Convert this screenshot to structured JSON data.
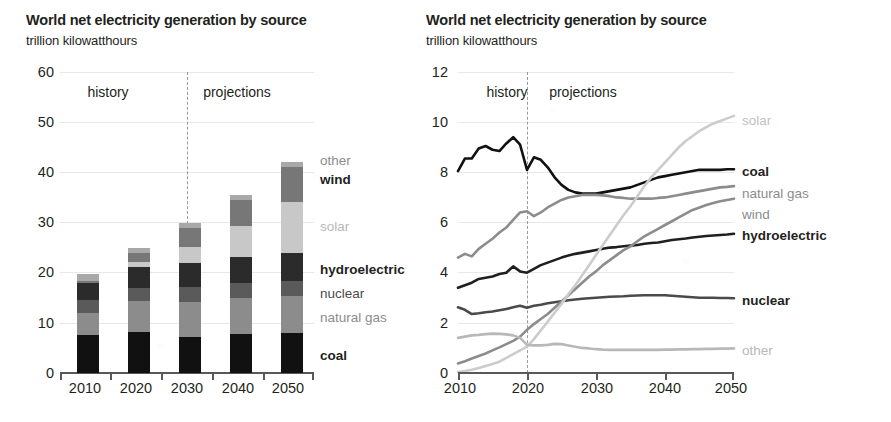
{
  "panels": [
    {
      "id": "stacked",
      "title": "World net electricity generation by source",
      "subtitle": "trillion kilowatthours",
      "era_history": "history",
      "era_projections": "projections",
      "y_ticks": [
        "60",
        "50",
        "40",
        "30",
        "20",
        "10",
        "0"
      ],
      "x_ticks": [
        "2010",
        "2020",
        "2030",
        "2040",
        "2050"
      ],
      "series_labels": [
        {
          "name": "other",
          "bold": false,
          "color": "#8c8c8c"
        },
        {
          "name": "wind",
          "bold": true,
          "color": "#231f20"
        },
        {
          "name": "solar",
          "bold": false,
          "color": "#b8b8b8"
        },
        {
          "name": "hydroelectric",
          "bold": true,
          "color": "#231f20"
        },
        {
          "name": "nuclear",
          "bold": false,
          "color": "#4a4a4a"
        },
        {
          "name": "natural gas",
          "bold": false,
          "color": "#8c8c8c"
        },
        {
          "name": "coal",
          "bold": true,
          "color": "#231f20"
        }
      ]
    },
    {
      "id": "lines",
      "title": "World net electricity generation by source",
      "subtitle": "trillion kilowatthours",
      "era_history": "history",
      "era_projections": "projections",
      "y_ticks": [
        "12",
        "10",
        "8",
        "6",
        "4",
        "2",
        "0"
      ],
      "x_ticks": [
        "2010",
        "2020",
        "2030",
        "2040",
        "2050"
      ],
      "series_labels": [
        {
          "name": "solar",
          "bold": false,
          "color": "#c2c2c2"
        },
        {
          "name": "coal",
          "bold": true,
          "color": "#231f20"
        },
        {
          "name": "natural gas",
          "bold": false,
          "color": "#8c8c8c"
        },
        {
          "name": "wind",
          "bold": false,
          "color": "#8c8c8c"
        },
        {
          "name": "hydroelectric",
          "bold": true,
          "color": "#231f20"
        },
        {
          "name": "nuclear",
          "bold": false,
          "color": "#4a4a4a"
        },
        {
          "name": "other",
          "bold": false,
          "color": "#b8b8b8"
        }
      ]
    }
  ],
  "chart_data": [
    {
      "type": "bar",
      "id": "stacked-bar-chart",
      "title": "World net electricity generation by source",
      "subtitle": "trillion kilowatthours",
      "xlabel": "",
      "ylabel": "trillion kilowatthours",
      "ylim": [
        0,
        60
      ],
      "ytick_values": [
        0,
        10,
        20,
        30,
        40,
        50,
        60
      ],
      "grid": true,
      "stacked": true,
      "legend_position": "right",
      "history_projection_divider": 2025,
      "categories": [
        "2010",
        "2020",
        "2030",
        "2040",
        "2050"
      ],
      "series": [
        {
          "name": "coal",
          "color": "#111111",
          "values": [
            7.5,
            8.1,
            7.2,
            7.7,
            8.0
          ]
        },
        {
          "name": "natural gas",
          "color": "#8c8c8c",
          "values": [
            4.5,
            6.2,
            7.0,
            7.2,
            7.4
          ]
        },
        {
          "name": "nuclear",
          "color": "#5a5a5a",
          "values": [
            2.6,
            2.7,
            2.9,
            3.1,
            3.0
          ]
        },
        {
          "name": "hydroelectric",
          "color": "#2b2b2b",
          "values": [
            3.4,
            4.2,
            4.8,
            5.2,
            5.5
          ]
        },
        {
          "name": "solar",
          "color": "#c8c8c8",
          "values": [
            0.0,
            1.0,
            3.3,
            6.2,
            10.2
          ]
        },
        {
          "name": "wind",
          "color": "#777777",
          "values": [
            0.4,
            1.7,
            3.7,
            5.0,
            6.9
          ]
        },
        {
          "name": "other",
          "color": "#a8a8a8",
          "values": [
            1.4,
            1.1,
            1.1,
            1.1,
            1.0
          ]
        }
      ],
      "totals": [
        20.3,
        25.0,
        30.0,
        35.5,
        42.0
      ]
    },
    {
      "type": "line",
      "id": "line-chart",
      "title": "World net electricity generation by source",
      "subtitle": "trillion kilowatthours",
      "xlabel": "",
      "ylabel": "trillion kilowatthours",
      "ylim": [
        0,
        12
      ],
      "xlim": [
        2010,
        2050
      ],
      "ytick_values": [
        0,
        2,
        4,
        6,
        8,
        10,
        12
      ],
      "xtick_values": [
        2010,
        2020,
        2030,
        2040,
        2050
      ],
      "grid": true,
      "legend_position": "right",
      "history_projection_divider": 2020,
      "x": [
        2010,
        2011,
        2012,
        2013,
        2014,
        2015,
        2016,
        2017,
        2018,
        2019,
        2020,
        2021,
        2022,
        2023,
        2024,
        2025,
        2026,
        2027,
        2028,
        2029,
        2030,
        2031,
        2032,
        2033,
        2034,
        2035,
        2036,
        2037,
        2038,
        2039,
        2040,
        2041,
        2042,
        2043,
        2044,
        2045,
        2046,
        2047,
        2048,
        2049,
        2050
      ],
      "series": [
        {
          "name": "coal",
          "color": "#111111",
          "width": 2.6,
          "values": [
            8.05,
            8.55,
            8.55,
            8.95,
            9.05,
            8.9,
            8.85,
            9.15,
            9.4,
            9.1,
            8.1,
            8.6,
            8.5,
            8.2,
            7.8,
            7.5,
            7.3,
            7.2,
            7.15,
            7.15,
            7.15,
            7.2,
            7.25,
            7.3,
            7.35,
            7.4,
            7.5,
            7.6,
            7.7,
            7.8,
            7.85,
            7.9,
            7.95,
            8.0,
            8.05,
            8.1,
            8.1,
            8.1,
            8.1,
            8.12,
            8.12
          ]
        },
        {
          "name": "natural gas",
          "color": "#8c8c8c",
          "width": 2.6,
          "values": [
            4.6,
            4.75,
            4.65,
            4.95,
            5.15,
            5.35,
            5.6,
            5.8,
            6.1,
            6.4,
            6.45,
            6.25,
            6.4,
            6.6,
            6.75,
            6.9,
            7.0,
            7.05,
            7.1,
            7.1,
            7.1,
            7.08,
            7.05,
            7.0,
            6.98,
            6.95,
            6.95,
            6.95,
            6.95,
            6.98,
            7.0,
            7.05,
            7.1,
            7.15,
            7.2,
            7.25,
            7.3,
            7.35,
            7.4,
            7.42,
            7.45
          ]
        },
        {
          "name": "hydroelectric",
          "color": "#1f1f1f",
          "width": 2.6,
          "values": [
            3.4,
            3.5,
            3.6,
            3.75,
            3.8,
            3.85,
            3.95,
            4.0,
            4.25,
            4.05,
            4.0,
            4.15,
            4.3,
            4.4,
            4.5,
            4.6,
            4.68,
            4.75,
            4.8,
            4.85,
            4.9,
            4.95,
            5.0,
            5.02,
            5.05,
            5.08,
            5.1,
            5.15,
            5.18,
            5.2,
            5.25,
            5.3,
            5.33,
            5.36,
            5.4,
            5.43,
            5.46,
            5.48,
            5.5,
            5.52,
            5.55
          ]
        },
        {
          "name": "nuclear",
          "color": "#4a4a4a",
          "width": 2.6,
          "values": [
            2.62,
            2.52,
            2.35,
            2.38,
            2.42,
            2.45,
            2.5,
            2.55,
            2.62,
            2.68,
            2.6,
            2.68,
            2.72,
            2.78,
            2.82,
            2.86,
            2.9,
            2.93,
            2.96,
            2.98,
            3.0,
            3.02,
            3.04,
            3.05,
            3.06,
            3.08,
            3.09,
            3.1,
            3.1,
            3.1,
            3.1,
            3.08,
            3.06,
            3.04,
            3.02,
            3.0,
            3.0,
            3.0,
            2.99,
            2.99,
            2.98
          ]
        },
        {
          "name": "wind",
          "color": "#8c8c8c",
          "width": 2.6,
          "values": [
            0.38,
            0.47,
            0.58,
            0.68,
            0.78,
            0.9,
            1.02,
            1.15,
            1.28,
            1.45,
            1.72,
            1.95,
            2.15,
            2.35,
            2.6,
            2.85,
            3.1,
            3.35,
            3.6,
            3.85,
            4.05,
            4.3,
            4.5,
            4.7,
            4.9,
            5.05,
            5.25,
            5.45,
            5.6,
            5.75,
            5.9,
            6.05,
            6.2,
            6.35,
            6.5,
            6.6,
            6.7,
            6.78,
            6.85,
            6.9,
            6.95
          ]
        },
        {
          "name": "solar",
          "color": "#cccccc",
          "width": 2.6,
          "values": [
            0.04,
            0.08,
            0.13,
            0.2,
            0.28,
            0.36,
            0.45,
            0.6,
            0.75,
            0.9,
            1.05,
            1.35,
            1.7,
            2.05,
            2.4,
            2.75,
            3.15,
            3.5,
            3.9,
            4.3,
            4.7,
            5.1,
            5.5,
            5.9,
            6.3,
            6.65,
            7.05,
            7.45,
            7.8,
            8.1,
            8.4,
            8.7,
            9.0,
            9.25,
            9.45,
            9.65,
            9.8,
            9.95,
            10.05,
            10.15,
            10.25
          ]
        },
        {
          "name": "other",
          "color": "#b8b8b8",
          "width": 2.6,
          "values": [
            1.4,
            1.45,
            1.5,
            1.52,
            1.55,
            1.57,
            1.56,
            1.54,
            1.5,
            1.4,
            1.12,
            1.1,
            1.1,
            1.12,
            1.16,
            1.15,
            1.1,
            1.05,
            1.0,
            0.98,
            0.95,
            0.93,
            0.92,
            0.92,
            0.92,
            0.92,
            0.92,
            0.92,
            0.92,
            0.92,
            0.93,
            0.93,
            0.94,
            0.94,
            0.95,
            0.95,
            0.96,
            0.96,
            0.97,
            0.97,
            0.98
          ]
        }
      ]
    }
  ]
}
